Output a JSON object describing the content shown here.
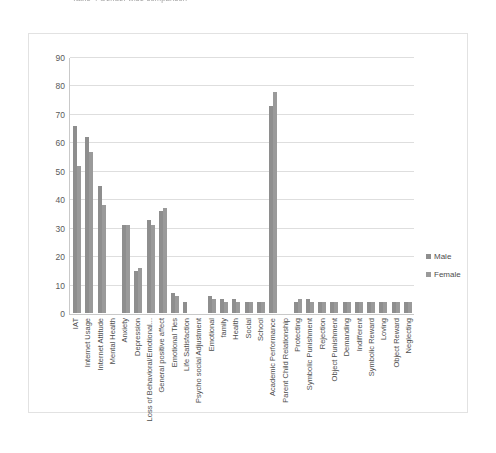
{
  "document": {
    "clipped_title": "Table 4 Gender wise comparison"
  },
  "legend": {
    "position": "right",
    "items": [
      {
        "label": "Male",
        "color": "#8e8e8e"
      },
      {
        "label": "Female",
        "color": "#9a9a9a"
      }
    ]
  },
  "axis": {
    "yticks": [
      "0",
      "10",
      "20",
      "30",
      "40",
      "50",
      "60",
      "70",
      "80",
      "90"
    ]
  },
  "chart_data": {
    "type": "bar",
    "title": "",
    "xlabel": "",
    "ylabel": "",
    "ylim": [
      0,
      90
    ],
    "ytick_step": 10,
    "grid": true,
    "legend_position": "right",
    "categories": [
      "IAT",
      "Internet Usage",
      "Internet Attitude",
      "Mental Health",
      "Anxiety",
      "Depression",
      "Loss of Behavioral/Emotional...",
      "General positive affect",
      "Emotional Ties",
      "Life Satisfaction",
      "Psycho social Adjustment",
      "Emotional",
      "family",
      "Health",
      "Social",
      "School",
      "Academic Performance",
      "Parent Child Relationship",
      "Protecting",
      "Symbolic Punishment",
      "Rejection",
      "Object Punishment",
      "Demanding",
      "Indifferent",
      "Symbolic Reward",
      "Loving",
      "Object Reward",
      "Neglecting"
    ],
    "series": [
      {
        "name": "Male",
        "color": "#8e8e8e",
        "values": [
          66,
          62,
          45,
          0,
          31,
          15,
          33,
          36,
          7,
          4,
          0,
          6,
          5,
          5,
          4,
          4,
          73,
          0,
          4,
          5,
          4,
          4,
          4,
          4,
          4,
          4,
          4,
          4
        ]
      },
      {
        "name": "Female",
        "color": "#9a9a9a",
        "values": [
          52,
          57,
          38,
          0,
          31,
          16,
          31,
          37,
          6,
          0,
          0,
          5,
          4,
          4,
          4,
          4,
          78,
          0,
          5,
          4,
          4,
          4,
          4,
          4,
          4,
          4,
          4,
          4
        ]
      }
    ]
  }
}
